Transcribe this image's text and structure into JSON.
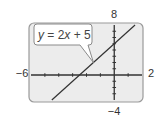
{
  "chart_data": {
    "type": "line",
    "title": "",
    "xlabel": "",
    "ylabel": "",
    "xlim": [
      -6,
      2
    ],
    "ylim": [
      -4,
      8
    ],
    "x_tick_step": 1,
    "y_tick_step": 1,
    "grid": false,
    "window_labels": {
      "xmin": "−6",
      "xmax": "2",
      "ymin": "−4",
      "ymax": "8"
    },
    "series": [
      {
        "name": "y = 2x + 5",
        "equation": {
          "slope": 2,
          "intercept": 5
        },
        "x": [
          -4.5,
          1.5
        ],
        "y": [
          -4,
          8
        ]
      }
    ],
    "annotation": {
      "text_parts": [
        "y",
        " = 2",
        "x",
        " + 5"
      ],
      "points_to": {
        "x": -1.5,
        "y": 2
      }
    },
    "colors": {
      "frame_fill": "#ececec",
      "frame_stroke": "#9a9a9a",
      "axis": "#333333",
      "line": "#333333",
      "callout_fill": "#ffffff",
      "callout_stroke": "#8a8a8a"
    }
  }
}
